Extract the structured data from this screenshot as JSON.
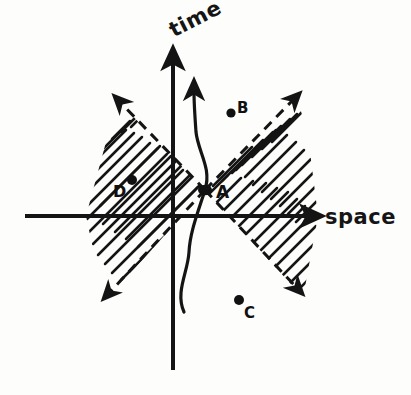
{
  "figure": {
    "kind": "hand-drawn-spacetime-diagram",
    "background_color": "#fdfdfb",
    "ink_color": "#141414"
  },
  "axes": {
    "vertical": {
      "name": "time-axis",
      "label": "time",
      "direction": "up",
      "arrow": true,
      "x": 173,
      "y_top": 55,
      "y_bottom": 370,
      "label_rotation_deg": -27
    },
    "horizontal": {
      "name": "space-axis",
      "label": "space",
      "direction": "right",
      "arrow": true,
      "y": 216,
      "x_left": 25,
      "x_right": 316
    },
    "origin": {
      "x": 173,
      "y": 216
    }
  },
  "lightcone": {
    "apex_label": "A",
    "apex": {
      "x": 205,
      "y": 190
    },
    "boundary_style": "dashed",
    "fill_style": "hatched",
    "arrows_on_boundaries": true,
    "branches": [
      {
        "name": "future-right",
        "direction": "up-right",
        "arrow_tip": {
          "x": 297,
          "y": 96
        }
      },
      {
        "name": "past-right",
        "direction": "down-right",
        "arrow_tip": {
          "x": 300,
          "y": 291
        }
      },
      {
        "name": "future-left",
        "direction": "up-left",
        "arrow_tip": {
          "x": 117,
          "y": 97
        }
      },
      {
        "name": "past-left",
        "direction": "down-left",
        "arrow_tip": {
          "x": 105,
          "y": 296
        }
      }
    ]
  },
  "worldline": {
    "name": "observer-worldline",
    "style": "solid-wavy",
    "arrow": true,
    "passes_through": "A",
    "arrow_tip": {
      "x": 195,
      "y": 84
    },
    "start": {
      "x": 184,
      "y": 312
    }
  },
  "events": [
    {
      "id": "A",
      "label": "A",
      "x": 205,
      "y": 190,
      "label_x": 216,
      "label_y": 182,
      "note": "apex-on-worldline"
    },
    {
      "id": "B",
      "label": "B",
      "x": 231,
      "y": 113,
      "label_x": 237,
      "label_y": 99,
      "note": "upper-right"
    },
    {
      "id": "C",
      "label": "C",
      "x": 239,
      "y": 300,
      "label_x": 244,
      "label_y": 304,
      "note": "lower-right"
    },
    {
      "id": "D",
      "label": "D",
      "x": 132,
      "y": 180,
      "label_x": 113,
      "label_y": 182,
      "note": "upper-left-in-cone"
    }
  ]
}
